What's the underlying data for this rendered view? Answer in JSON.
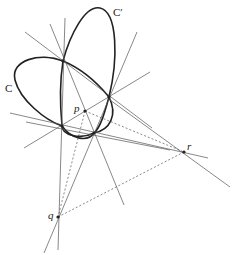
{
  "diagram": {
    "labels": {
      "conic_c": "C",
      "conic_c_prime": "C′",
      "point_p": "p",
      "point_q": "q",
      "point_r": "r"
    },
    "points": {
      "P1": [
        63,
        61
      ],
      "P2": [
        109,
        97
      ],
      "P3": [
        62,
        126
      ],
      "P4": [
        94,
        133
      ],
      "p": [
        85,
        111
      ],
      "q": [
        58,
        217
      ],
      "r": [
        184,
        152
      ]
    }
  }
}
